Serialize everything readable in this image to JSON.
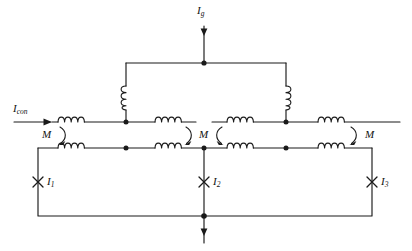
{
  "diagram": {
    "type": "electrical-circuit-schematic",
    "stroke_color": "#1a1a1a",
    "background_color": "#ffffff",
    "labels": {
      "source_current": {
        "symbol": "I",
        "subscript": "con",
        "text": "Icon"
      },
      "top_current": {
        "symbol": "I",
        "subscript": "g",
        "text": "Ig"
      },
      "mutual_left": {
        "text": "M"
      },
      "mutual_middle": {
        "text": "M"
      },
      "mutual_right": {
        "text": "M"
      },
      "loop_current_1": {
        "symbol": "I",
        "subscript": "1",
        "text": "I1"
      },
      "loop_current_2": {
        "symbol": "I",
        "subscript": "2",
        "text": "I2"
      },
      "loop_current_3": {
        "symbol": "I",
        "subscript": "3",
        "text": "I3"
      }
    },
    "components": {
      "horizontal_inductors_top": 4,
      "horizontal_inductors_bottom": 4,
      "vertical_inductors": 2,
      "junction_nodes": 6,
      "mutual_coupling_markers": 3,
      "current_cross_markers": 3
    }
  }
}
